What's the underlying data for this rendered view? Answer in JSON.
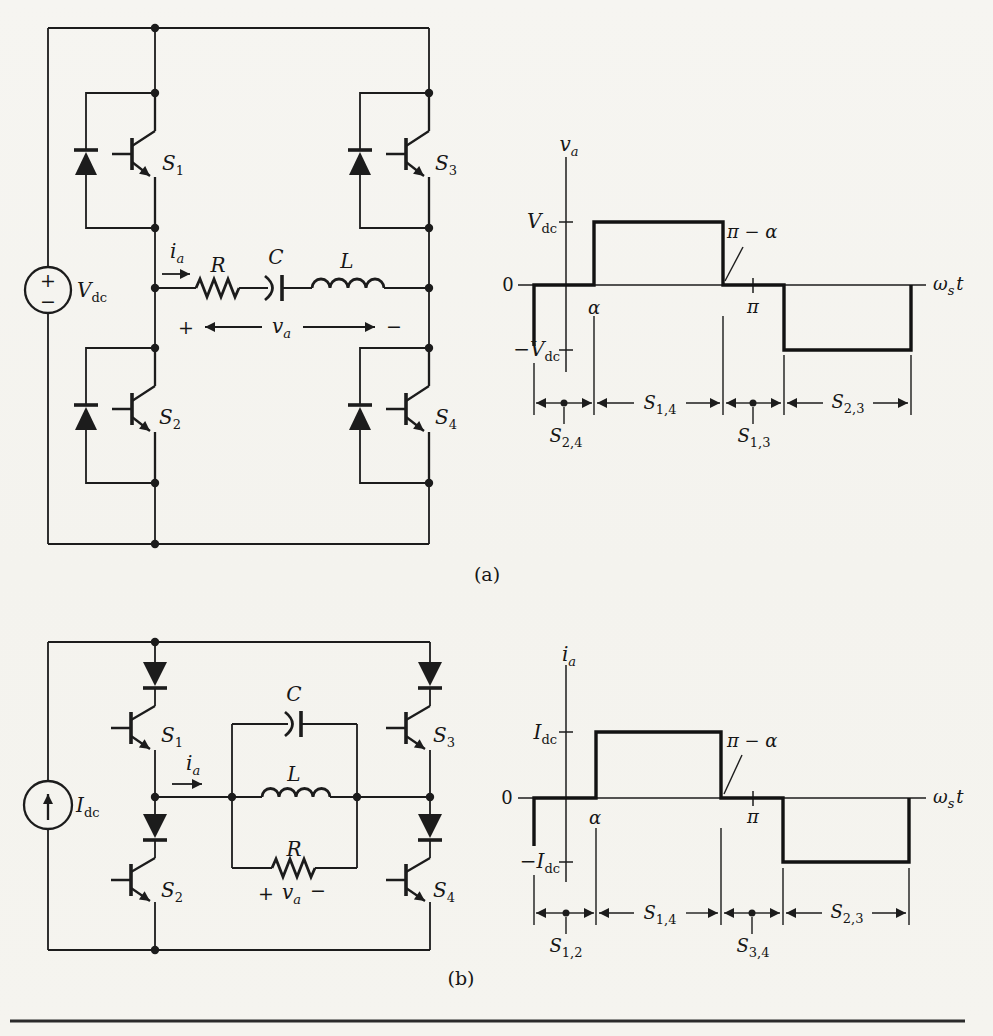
{
  "captions": {
    "a": "(a)",
    "b": "(b)"
  },
  "circuit_a": {
    "source": {
      "plus": "+",
      "minus": "−",
      "label": {
        "main": "V",
        "sub": "dc"
      }
    },
    "sw1": {
      "main": "S",
      "sub": "1"
    },
    "sw2": {
      "main": "S",
      "sub": "2"
    },
    "sw3": {
      "main": "S",
      "sub": "3"
    },
    "sw4": {
      "main": "S",
      "sub": "4"
    },
    "current": {
      "main": "i",
      "sub": "a"
    },
    "resistor": "R",
    "capacitor": "C",
    "inductor": "L",
    "load_voltage": {
      "plus": "+",
      "main": "v",
      "sub": "a",
      "minus": "−"
    }
  },
  "waveform_a": {
    "y_label": {
      "main": "v",
      "sub": "a"
    },
    "tick_pos": {
      "main": "V",
      "sub": "dc"
    },
    "tick_zero": "0",
    "tick_neg": {
      "main": "−V",
      "sub": "dc"
    },
    "x_label": {
      "main": "ω",
      "sub": "s",
      "tail": "t"
    },
    "alpha": "α",
    "pi": "π",
    "pi_minus_alpha": "π − α",
    "int1": {
      "main": "S",
      "sub": "2,4"
    },
    "int2": {
      "main": "S",
      "sub": "1,4"
    },
    "int3": {
      "main": "S",
      "sub": "1,3"
    },
    "int4": {
      "main": "S",
      "sub": "2,3"
    },
    "trace_levels": [
      "0 from start to α",
      "+Vdc from α to π−α",
      "0 from π−α to π+α",
      "−Vdc from π+α to end"
    ]
  },
  "circuit_b": {
    "source": {
      "label": {
        "main": "I",
        "sub": "dc"
      }
    },
    "sw1": {
      "main": "S",
      "sub": "1"
    },
    "sw2": {
      "main": "S",
      "sub": "2"
    },
    "sw3": {
      "main": "S",
      "sub": "3"
    },
    "sw4": {
      "main": "S",
      "sub": "4"
    },
    "current": {
      "main": "i",
      "sub": "a"
    },
    "resistor": "R",
    "capacitor": "C",
    "inductor": "L",
    "load_voltage": {
      "plus": "+",
      "main": "v",
      "sub": "a",
      "minus": "−"
    }
  },
  "waveform_b": {
    "y_label": {
      "main": "i",
      "sub": "a"
    },
    "tick_pos": {
      "main": "I",
      "sub": "dc"
    },
    "tick_zero": "0",
    "tick_neg": {
      "main": "−I",
      "sub": "dc"
    },
    "x_label": {
      "main": "ω",
      "sub": "s",
      "tail": "t"
    },
    "alpha": "α",
    "pi": "π",
    "pi_minus_alpha": "π − α",
    "int1": {
      "main": "S",
      "sub": "1,2"
    },
    "int2": {
      "main": "S",
      "sub": "1,4"
    },
    "int3": {
      "main": "S",
      "sub": "3,4"
    },
    "int4": {
      "main": "S",
      "sub": "2,3"
    },
    "trace_levels": [
      "0 from start to α",
      "+Idc from α to π−α",
      "0 from π−α to π+α",
      "−Idc from π+α to end"
    ]
  }
}
